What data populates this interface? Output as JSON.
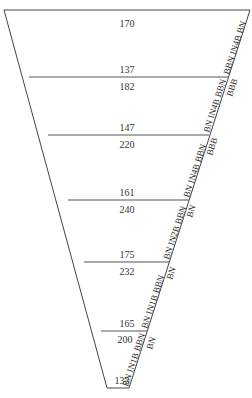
{
  "diagram": {
    "sections": [
      {
        "top": "170",
        "bottom": "137"
      },
      {
        "top": "182",
        "bottom": "147"
      },
      {
        "top": "220",
        "bottom": "161"
      },
      {
        "top": "240",
        "bottom": "175"
      },
      {
        "top": "232",
        "bottom": "165"
      },
      {
        "top": "200",
        "bottom": "133"
      }
    ],
    "edge_labels_inner": [
      "BBN IN4B BN",
      "BN IN4B BBN",
      "BN IN4B BBN",
      "BN IN2B BBN",
      "BN IN1B BBN",
      "BN IN1B BBN"
    ],
    "edge_labels_outer": [
      "BBB",
      "BBB",
      "BN",
      "BN",
      "BN"
    ]
  }
}
